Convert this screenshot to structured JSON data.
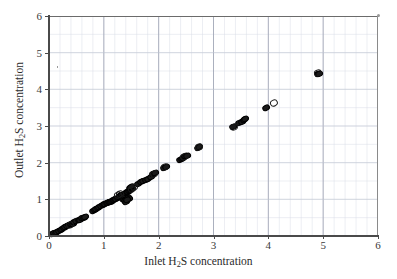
{
  "figure": {
    "background": "#ffffff",
    "frame_color": "#4a4a4a",
    "grid_color": "#d9dce6",
    "marker_color": "#1a1a1a"
  },
  "chart_data": {
    "type": "scatter",
    "title": "",
    "xlabel_parts": {
      "pre": "Inlet H",
      "sub": "2",
      "post": "S concentration"
    },
    "ylabel_parts": {
      "pre": "Outlet H",
      "sub": "2",
      "post": "S concentration"
    },
    "xlabel": "Inlet H2S concentration",
    "ylabel": "Outlet H2S concentration",
    "xlim": [
      0,
      6
    ],
    "ylim": [
      0,
      6
    ],
    "xticks": [
      0,
      1,
      2,
      3,
      4,
      5,
      6
    ],
    "yticks": [
      0,
      1,
      2,
      3,
      4,
      5,
      6
    ],
    "xtick_labels": [
      "0",
      "1",
      "2",
      "3",
      "4",
      "5",
      "6"
    ],
    "ytick_labels": [
      "0",
      "1",
      "2",
      "3",
      "4",
      "5",
      "6"
    ],
    "grid": true,
    "grid_major_step": 1.0,
    "grid_minor_step_x": 0.2,
    "grid_minor_step_y": 0.5,
    "legend": null,
    "series": [
      {
        "name": "measured pairs (filled)",
        "marker": "filled-ellipse",
        "points": [
          [
            0.06,
            0.05
          ],
          [
            0.09,
            0.07
          ],
          [
            0.12,
            0.09
          ],
          [
            0.15,
            0.11
          ],
          [
            0.18,
            0.14
          ],
          [
            0.21,
            0.16
          ],
          [
            0.24,
            0.18
          ],
          [
            0.27,
            0.21
          ],
          [
            0.3,
            0.24
          ],
          [
            0.33,
            0.27
          ],
          [
            0.36,
            0.29
          ],
          [
            0.4,
            0.32
          ],
          [
            0.43,
            0.34
          ],
          [
            0.46,
            0.37
          ],
          [
            0.5,
            0.4
          ],
          [
            0.54,
            0.43
          ],
          [
            0.57,
            0.45
          ],
          [
            0.6,
            0.48
          ],
          [
            0.63,
            0.5
          ],
          [
            0.66,
            0.52
          ],
          [
            0.8,
            0.69
          ],
          [
            0.83,
            0.72
          ],
          [
            0.86,
            0.74
          ],
          [
            0.89,
            0.77
          ],
          [
            0.92,
            0.79
          ],
          [
            0.95,
            0.81
          ],
          [
            0.98,
            0.84
          ],
          [
            1.0,
            0.86
          ],
          [
            1.03,
            0.87
          ],
          [
            1.05,
            0.89
          ],
          [
            1.07,
            0.9
          ],
          [
            1.09,
            0.92
          ],
          [
            1.11,
            0.93
          ],
          [
            1.13,
            0.94
          ],
          [
            1.15,
            0.96
          ],
          [
            1.17,
            0.97
          ],
          [
            1.19,
            0.98
          ],
          [
            1.21,
            1.0
          ],
          [
            1.23,
            1.02
          ],
          [
            1.25,
            1.05
          ],
          [
            1.27,
            1.07
          ],
          [
            1.29,
            1.09
          ],
          [
            1.31,
            1.11
          ],
          [
            1.33,
            1.12
          ],
          [
            1.35,
            1.02
          ],
          [
            1.37,
            1.0
          ],
          [
            1.39,
            0.96
          ],
          [
            1.41,
            0.93
          ],
          [
            1.36,
            1.08
          ],
          [
            1.38,
            1.13
          ],
          [
            1.4,
            1.16
          ],
          [
            1.42,
            1.19
          ],
          [
            1.44,
            1.21
          ],
          [
            1.46,
            1.23
          ],
          [
            1.48,
            1.25
          ],
          [
            1.5,
            1.27
          ],
          [
            1.52,
            1.29
          ],
          [
            1.47,
            1.32
          ],
          [
            1.49,
            1.33
          ],
          [
            1.44,
            1.05
          ],
          [
            1.46,
            1.01
          ],
          [
            1.43,
            0.98
          ],
          [
            1.62,
            1.42
          ],
          [
            1.68,
            1.47
          ],
          [
            1.72,
            1.5
          ],
          [
            1.76,
            1.53
          ],
          [
            1.8,
            1.56
          ],
          [
            1.86,
            1.62
          ],
          [
            1.9,
            1.68
          ],
          [
            1.94,
            1.72
          ],
          [
            2.1,
            1.86
          ],
          [
            2.14,
            1.88
          ],
          [
            2.38,
            2.06
          ],
          [
            2.42,
            2.1
          ],
          [
            2.45,
            2.14
          ],
          [
            2.48,
            2.17
          ],
          [
            2.51,
            2.19
          ],
          [
            2.72,
            2.41
          ],
          [
            2.74,
            2.43
          ],
          [
            3.36,
            2.96
          ],
          [
            3.47,
            3.08
          ],
          [
            3.52,
            3.12
          ],
          [
            3.56,
            3.16
          ],
          [
            3.58,
            3.19
          ],
          [
            3.95,
            3.5
          ],
          [
            4.9,
            4.41
          ],
          [
            4.92,
            4.43
          ]
        ]
      },
      {
        "name": "measured pairs (open)",
        "marker": "open-circle",
        "points": [
          [
            0.38,
            0.31
          ],
          [
            1.26,
            1.12
          ],
          [
            1.3,
            1.15
          ],
          [
            1.51,
            1.29
          ],
          [
            1.91,
            1.7
          ],
          [
            2.12,
            1.89
          ],
          [
            2.47,
            2.16
          ],
          [
            3.38,
            2.97
          ],
          [
            4.1,
            3.64
          ],
          [
            4.91,
            4.44
          ],
          [
            1.55,
            1.33
          ],
          [
            2.73,
            2.42
          ]
        ]
      }
    ]
  }
}
